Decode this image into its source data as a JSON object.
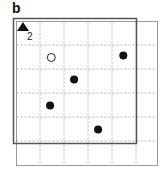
{
  "panel_label": "b",
  "marker": {
    "icon": "triangle-up-icon",
    "label": "2"
  },
  "grid": {
    "rows": 6,
    "cols": 6
  },
  "colors": {
    "grid_line": "#9a9a9a",
    "frame": "#555555",
    "filled": "#111111",
    "open_fill": "#ffffff",
    "open_stroke": "#222222"
  },
  "points": [
    {
      "type": "open",
      "col": 1.45,
      "row": 1.5
    },
    {
      "type": "filled",
      "col": 4.45,
      "row": 1.42
    },
    {
      "type": "filled",
      "col": 2.4,
      "row": 2.42
    },
    {
      "type": "filled",
      "col": 1.4,
      "row": 3.5
    },
    {
      "type": "filled",
      "col": 3.4,
      "row": 4.5
    }
  ]
}
